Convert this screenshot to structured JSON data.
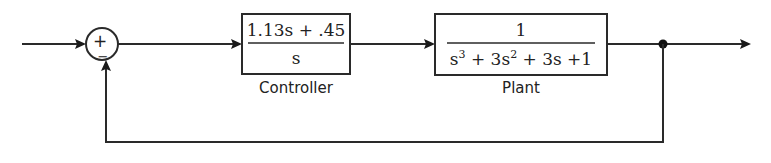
{
  "diagram": {
    "type": "feedback-control-block-diagram",
    "summing_junction": {
      "plus_sign": "+",
      "minus_sign": "−"
    },
    "controller": {
      "numerator": "1.13s + .45",
      "denominator": "s",
      "label": "Controller"
    },
    "plant": {
      "numerator": "1",
      "denominator_parts": [
        "s",
        "3",
        " + 3s",
        "2",
        " + 3s +1"
      ],
      "label": "Plant"
    },
    "feedback": {
      "type": "unity",
      "sign": "negative"
    },
    "colors": {
      "line": "#2a2a2a",
      "background": "#ffffff"
    }
  }
}
